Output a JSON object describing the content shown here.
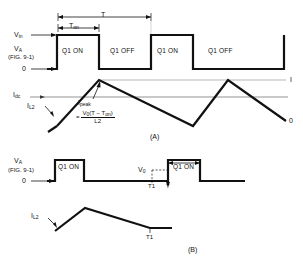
{
  "figure": {
    "panels": [
      {
        "tag": "(A)",
        "voltage_axis": {
          "top_label": "Vin",
          "top_label_base": "V",
          "top_label_sub": "in",
          "mid_label_base": "V",
          "mid_label_sub": "A",
          "mid_label_ref": "(FIG. 9-1)",
          "zero_label": "0"
        },
        "timing": {
          "period_label": "T",
          "on_time_label_base": "T",
          "on_time_label_sub": "on"
        },
        "states": [
          "Q1 ON",
          "Q1 OFF",
          "Q1 ON",
          "Q1 OFF"
        ],
        "current_axis": {
          "dc_label_base": "I",
          "dc_label_sub": "dc",
          "inductor_label_base": "I",
          "inductor_label_sub": "L2",
          "right_top_label": "I",
          "right_bottom_label": "0"
        },
        "annotation": {
          "peak_label_base": "I",
          "peak_label_sub": "peak",
          "equals": "=",
          "numerator": "V0(T − Ton)",
          "numerator_main": "V",
          "numerator_sub": "0",
          "numerator_rest": "(T − T",
          "numerator_sub2": "on",
          "numerator_close": ")",
          "denominator": "L2"
        }
      },
      {
        "tag": "(B)",
        "voltage_axis": {
          "mid_label_base": "V",
          "mid_label_sub": "A",
          "mid_label_ref": "(FIG. 9-1)",
          "zero_label": "0"
        },
        "states": [
          "Q1 ON",
          "Q1 ON"
        ],
        "markers": {
          "vo_label_base": "V",
          "vo_label_sub": "0",
          "t1_label": "T1",
          "t_label": "T",
          "current_t1_label": "T1"
        },
        "current_axis": {
          "inductor_label_base": "I",
          "inductor_label_sub": "L2"
        }
      }
    ],
    "colors": {
      "waveform": "#111111",
      "thin_line": "#555555",
      "background": "#ffffff"
    }
  }
}
